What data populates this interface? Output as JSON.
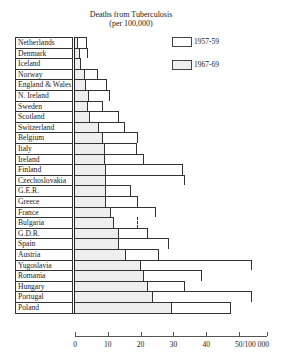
{
  "chart_data": {
    "type": "bar",
    "orientation": "horizontal",
    "title": "Deaths from Tuberculosis",
    "subtitle": "(per 100,000)",
    "xlabel": "",
    "ylabel": "",
    "xlim": [
      0,
      58
    ],
    "x_ticks": [
      "0",
      "10",
      "20",
      "30",
      "40",
      "50/100 000"
    ],
    "x_tick_values": [
      0,
      10,
      20,
      30,
      40,
      50
    ],
    "grid": false,
    "legend_position": "top-right",
    "categories": [
      "Netherlands",
      "Denmark",
      "Iceland",
      "Norway",
      "England & Wales",
      "N. Ireland",
      "Sweden",
      "Scotland",
      "Switzerland",
      "Belgium",
      "Italy",
      "Ireland",
      "Finland",
      "Czechoslovakia",
      "G.E.R.",
      "Greece",
      "France",
      "Bulgaria",
      "G.D.R.",
      "Spain",
      "Austria",
      "Yugoslavia",
      "Romania",
      "Hungary",
      "Portugal",
      "Poland"
    ],
    "series": [
      {
        "name": "1957-59",
        "style": "white",
        "values": [
          3.7,
          4.1,
          1.9,
          6.9,
          9.7,
          10.6,
          8.4,
          13.5,
          15.3,
          19.1,
          18.9,
          20.9,
          32.9,
          33.4,
          17.2,
          19.2,
          24.8,
          19.1,
          22.2,
          28.6,
          25.5,
          54.0,
          38.8,
          33.4,
          54.1,
          47.6
        ]
      },
      {
        "name": "1967-69",
        "style": "dotted",
        "values": [
          0.9,
          1.4,
          1.9,
          3.1,
          3.4,
          4.2,
          4.1,
          4.6,
          7.4,
          8.4,
          9.2,
          9.2,
          9.3,
          9.6,
          9.5,
          9.5,
          11.0,
          12.0,
          13.3,
          13.5,
          15.5,
          20.0,
          21.1,
          22.3,
          23.9,
          29.5
        ]
      }
    ],
    "annotations": [
      "Bulgaria 1957-59 bar drawn with dashed right edge"
    ]
  },
  "legend": [
    {
      "label": "1957-59",
      "style": "white"
    },
    {
      "label": "1967-69",
      "style": "dotted"
    }
  ],
  "layout": {
    "origin_x": 75,
    "px_per_unit": 3.28,
    "row_top": 37,
    "row_height": 10.6,
    "label_left": 15
  }
}
